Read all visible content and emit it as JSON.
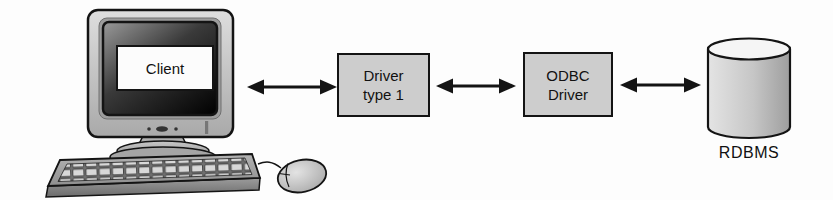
{
  "background_color": "#fdfdfd",
  "diagram": {
    "nodes": {
      "client": {
        "label": "Client",
        "type": "computer-illustration"
      },
      "driver_type1": {
        "line1": "Driver",
        "line2": "type 1",
        "type": "box"
      },
      "odbc_driver": {
        "line1": "ODBC",
        "line2": "Driver",
        "type": "box"
      },
      "rdbms": {
        "label": "RDBMS",
        "type": "database-cylinder"
      }
    },
    "connections": [
      {
        "from": "client",
        "to": "driver_type1",
        "style": "double-headed-arrow"
      },
      {
        "from": "driver_type1",
        "to": "odbc_driver",
        "style": "double-headed-arrow"
      },
      {
        "from": "odbc_driver",
        "to": "rdbms",
        "style": "double-headed-arrow"
      }
    ],
    "colors": {
      "box_fill": "#cdcdcd",
      "box_border": "#141414",
      "arrow": "#141414",
      "cylinder_fill": "#c6c6c6",
      "cylinder_top": "#f5f5f5",
      "screen_label_bg": "#fcfcfc"
    }
  }
}
